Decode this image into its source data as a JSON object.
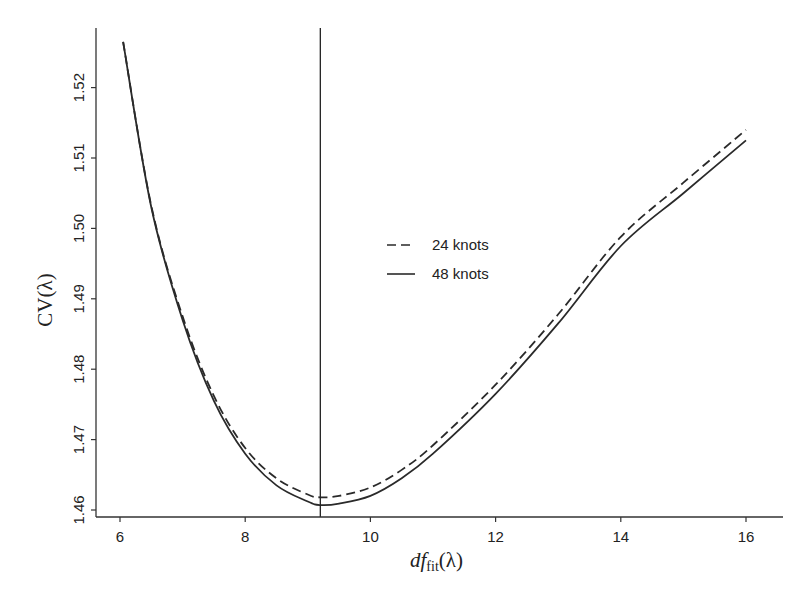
{
  "chart_data": {
    "type": "line",
    "title": "",
    "xlabel": "df_fit(λ)",
    "xlabel_parts": {
      "main": "df",
      "sub": "fit",
      "arg": "(λ)"
    },
    "ylabel": "CV(λ)",
    "xlim": [
      5.6,
      16.4
    ],
    "ylim": [
      1.4592,
      1.5306
    ],
    "x_ticks": [
      6,
      8,
      10,
      12,
      14,
      16
    ],
    "x_tick_labels": [
      "6",
      "8",
      "10",
      "12",
      "14",
      "16"
    ],
    "y_ticks": [
      1.46,
      1.47,
      1.48,
      1.49,
      1.5,
      1.51,
      1.52
    ],
    "y_tick_labels": [
      "1.46",
      "1.47",
      "1.48",
      "1.49",
      "1.50",
      "1.51",
      "1.52"
    ],
    "grid": false,
    "legend_position": "center",
    "vertical_reference_line": {
      "x": 9.2,
      "label": ""
    },
    "series": [
      {
        "name": "24 knots",
        "style": "dashed",
        "x": [
          6.05,
          6.5,
          7.0,
          7.5,
          8.0,
          8.5,
          9.0,
          9.2,
          9.5,
          10.0,
          10.5,
          11.0,
          12.0,
          13.0,
          14.0,
          15.0,
          16.0
        ],
        "values": [
          1.5265,
          1.5032,
          1.4875,
          1.4762,
          1.4688,
          1.4645,
          1.4622,
          1.4618,
          1.462,
          1.4632,
          1.4657,
          1.4692,
          1.4778,
          1.4878,
          1.4988,
          1.5065,
          1.514
        ]
      },
      {
        "name": "48 knots",
        "style": "solid",
        "x": [
          6.05,
          6.5,
          7.0,
          7.5,
          8.0,
          8.5,
          9.0,
          9.2,
          9.5,
          10.0,
          10.5,
          11.0,
          12.0,
          13.0,
          14.0,
          15.0,
          16.0
        ],
        "values": [
          1.5265,
          1.503,
          1.487,
          1.4755,
          1.468,
          1.4635,
          1.4612,
          1.4607,
          1.4609,
          1.462,
          1.4645,
          1.468,
          1.4765,
          1.4865,
          1.4975,
          1.505,
          1.5125
        ]
      }
    ]
  },
  "legend": {
    "items": [
      {
        "label": "24 knots",
        "style": "dashed"
      },
      {
        "label": "48 knots",
        "style": "solid"
      }
    ]
  },
  "axes": {
    "x_title_main": "df",
    "x_title_sub": "fit",
    "x_title_arg": "(λ)",
    "y_title": "CV(λ)"
  },
  "colors": {
    "line": "#2a2a2a",
    "axis": "#333333",
    "background": "#ffffff"
  }
}
